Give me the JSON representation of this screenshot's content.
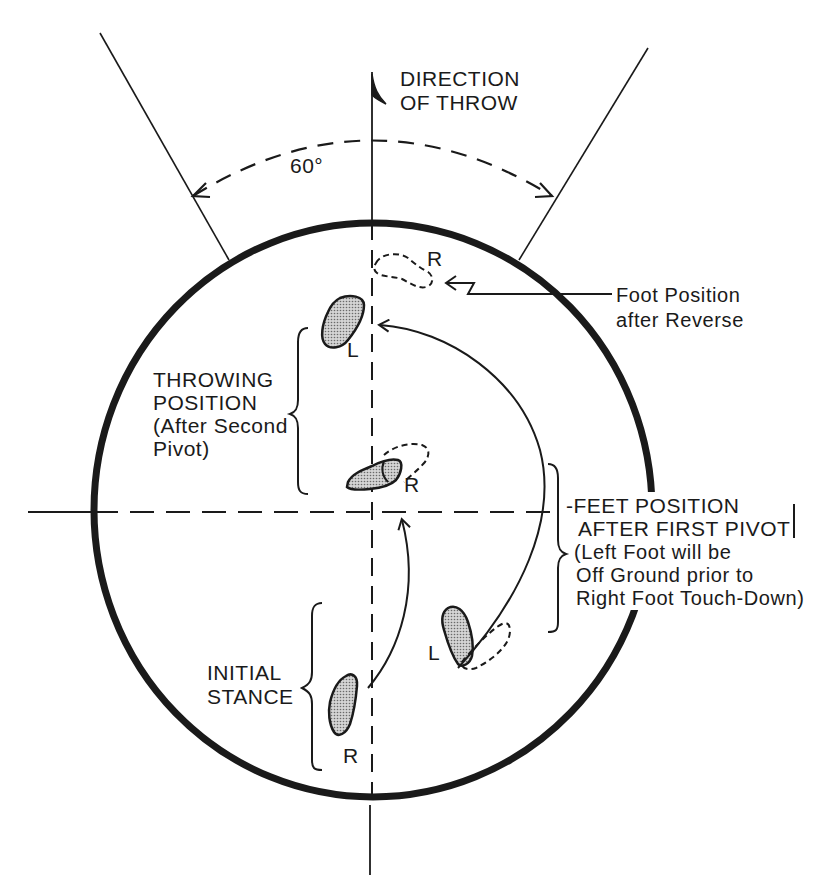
{
  "diagram": {
    "title_direction": [
      "DIRECTION",
      "OF THROW"
    ],
    "angle_label": "60°",
    "labels": {
      "foot_after_reverse": [
        "Foot Position",
        "after Reverse"
      ],
      "throwing_position": [
        "THROWING",
        "POSITION",
        "(After Second",
        "Pivot)"
      ],
      "feet_after_first_pivot": [
        "-FEET POSITION",
        "AFTER FIRST PIVOT",
        "(Left Foot will be",
        "Off Ground prior to",
        "Right Foot Touch-Down)"
      ],
      "initial_stance": [
        "INITIAL",
        "STANCE"
      ]
    },
    "foot_letters": {
      "reverse_r": "R",
      "throwing_l": "L",
      "throwing_r": "R",
      "pivot_l": "L",
      "initial_r": "R"
    },
    "colors": {
      "ink": "#1a1a1a",
      "background": "#ffffff",
      "foot_fill": "#b8b8b8"
    }
  }
}
